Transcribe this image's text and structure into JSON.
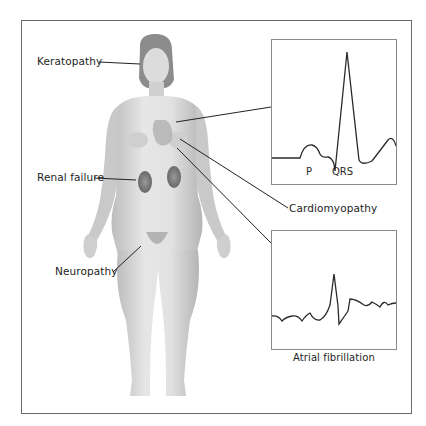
{
  "figure": {
    "labels": {
      "keratopathy": "Keratopathy",
      "renal_failure": "Renal failure",
      "neuropathy": "Neuropathy",
      "cardiomyopathy": "Cardiomyopathy",
      "atrial_fibrillation": "Atrial fibrillation"
    },
    "ecg_normal": {
      "p_label": "P",
      "qrs_label": "QRS"
    },
    "colors": {
      "frame": "#6a6a6a",
      "ecg_border": "#8a8a8a",
      "trace": "#2b2b2b",
      "skin": "#d9d9d9",
      "kidney": "#7a7a7a"
    }
  }
}
